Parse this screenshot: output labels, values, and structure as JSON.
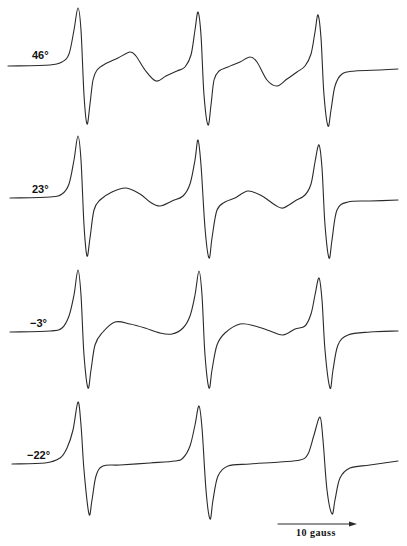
{
  "chart_data": {
    "type": "line",
    "title": "",
    "xlabel": "Magnetic field",
    "ylabel": "",
    "scale_bar": {
      "label": "10 gauss",
      "x1": 278,
      "x2": 357,
      "y": 524
    },
    "legend": [],
    "series": [
      {
        "name": "46°",
        "label": "46°",
        "label_pos": [
          32,
          55
        ],
        "points": [
          [
            8,
            66
          ],
          [
            50,
            65
          ],
          [
            62,
            62
          ],
          [
            69,
            54
          ],
          [
            74,
            30
          ],
          [
            78,
            8
          ],
          [
            81,
            30
          ],
          [
            84,
            95
          ],
          [
            87,
            124
          ],
          [
            90,
            104
          ],
          [
            93,
            80
          ],
          [
            97,
            70
          ],
          [
            105,
            64
          ],
          [
            118,
            58
          ],
          [
            130,
            52
          ],
          [
            136,
            56
          ],
          [
            145,
            70
          ],
          [
            156,
            81
          ],
          [
            166,
            76
          ],
          [
            177,
            71
          ],
          [
            185,
            67
          ],
          [
            191,
            55
          ],
          [
            195,
            30
          ],
          [
            198,
            12
          ],
          [
            201,
            35
          ],
          [
            204,
            95
          ],
          [
            208,
            125
          ],
          [
            211,
            105
          ],
          [
            214,
            80
          ],
          [
            219,
            71
          ],
          [
            228,
            67
          ],
          [
            240,
            62
          ],
          [
            250,
            57
          ],
          [
            257,
            62
          ],
          [
            267,
            80
          ],
          [
            277,
            86
          ],
          [
            287,
            79
          ],
          [
            297,
            72
          ],
          [
            305,
            66
          ],
          [
            311,
            54
          ],
          [
            315,
            32
          ],
          [
            318,
            15
          ],
          [
            321,
            38
          ],
          [
            324,
            95
          ],
          [
            328,
            126
          ],
          [
            331,
            110
          ],
          [
            335,
            86
          ],
          [
            342,
            74
          ],
          [
            355,
            71
          ],
          [
            380,
            70
          ],
          [
            398,
            69
          ]
        ]
      },
      {
        "name": "23°",
        "label": "23°",
        "label_pos": [
          32,
          189
        ],
        "points": [
          [
            10,
            198
          ],
          [
            50,
            197
          ],
          [
            62,
            194
          ],
          [
            69,
            184
          ],
          [
            74,
            160
          ],
          [
            78,
            136
          ],
          [
            81,
            160
          ],
          [
            84,
            225
          ],
          [
            87,
            256
          ],
          [
            90,
            238
          ],
          [
            94,
            210
          ],
          [
            100,
            200
          ],
          [
            112,
            192
          ],
          [
            126,
            188
          ],
          [
            140,
            194
          ],
          [
            150,
            202
          ],
          [
            160,
            206
          ],
          [
            172,
            201
          ],
          [
            183,
            196
          ],
          [
            190,
            184
          ],
          [
            195,
            160
          ],
          [
            198,
            140
          ],
          [
            201,
            165
          ],
          [
            205,
            228
          ],
          [
            209,
            258
          ],
          [
            212,
            238
          ],
          [
            217,
            210
          ],
          [
            225,
            202
          ],
          [
            235,
            198
          ],
          [
            248,
            191
          ],
          [
            262,
            196
          ],
          [
            275,
            205
          ],
          [
            283,
            208
          ],
          [
            295,
            201
          ],
          [
            305,
            195
          ],
          [
            311,
            184
          ],
          [
            315,
            162
          ],
          [
            319,
            145
          ],
          [
            322,
            168
          ],
          [
            325,
            225
          ],
          [
            329,
            258
          ],
          [
            332,
            240
          ],
          [
            337,
            210
          ],
          [
            348,
            202
          ],
          [
            370,
            201
          ],
          [
            398,
            200
          ]
        ]
      },
      {
        "name": "-3°",
        "label": "−3°",
        "label_pos": [
          30,
          323
        ],
        "points": [
          [
            10,
            332
          ],
          [
            50,
            331
          ],
          [
            62,
            328
          ],
          [
            69,
            316
          ],
          [
            74,
            295
          ],
          [
            78,
            270
          ],
          [
            81,
            295
          ],
          [
            84,
            355
          ],
          [
            88,
            388
          ],
          [
            91,
            370
          ],
          [
            95,
            345
          ],
          [
            102,
            333
          ],
          [
            115,
            322
          ],
          [
            130,
            324
          ],
          [
            145,
            328
          ],
          [
            160,
            333
          ],
          [
            172,
            334
          ],
          [
            183,
            328
          ],
          [
            190,
            316
          ],
          [
            195,
            295
          ],
          [
            199,
            271
          ],
          [
            202,
            295
          ],
          [
            205,
            355
          ],
          [
            209,
            388
          ],
          [
            212,
            370
          ],
          [
            217,
            345
          ],
          [
            225,
            333
          ],
          [
            240,
            324
          ],
          [
            255,
            326
          ],
          [
            270,
            331
          ],
          [
            283,
            335
          ],
          [
            295,
            329
          ],
          [
            305,
            326
          ],
          [
            311,
            314
          ],
          [
            315,
            295
          ],
          [
            319,
            278
          ],
          [
            322,
            300
          ],
          [
            325,
            350
          ],
          [
            330,
            388
          ],
          [
            333,
            370
          ],
          [
            338,
            345
          ],
          [
            348,
            335
          ],
          [
            370,
            332
          ],
          [
            398,
            331
          ]
        ]
      },
      {
        "name": "-22°",
        "label": "−22°",
        "label_pos": [
          27,
          455
        ],
        "points": [
          [
            12,
            464
          ],
          [
            45,
            463
          ],
          [
            60,
            458
          ],
          [
            67,
            448
          ],
          [
            73,
            430
          ],
          [
            78,
            402
          ],
          [
            81,
            425
          ],
          [
            84,
            470
          ],
          [
            89,
            514
          ],
          [
            92,
            500
          ],
          [
            96,
            476
          ],
          [
            103,
            466
          ],
          [
            120,
            465
          ],
          [
            150,
            463
          ],
          [
            175,
            461
          ],
          [
            183,
            458
          ],
          [
            190,
            446
          ],
          [
            195,
            425
          ],
          [
            199,
            406
          ],
          [
            202,
            428
          ],
          [
            206,
            490
          ],
          [
            210,
            519
          ],
          [
            213,
            500
          ],
          [
            218,
            476
          ],
          [
            228,
            466
          ],
          [
            250,
            464
          ],
          [
            280,
            462
          ],
          [
            300,
            460
          ],
          [
            308,
            454
          ],
          [
            314,
            435
          ],
          [
            320,
            417
          ],
          [
            323,
            440
          ],
          [
            327,
            490
          ],
          [
            332,
            514
          ],
          [
            335,
            500
          ],
          [
            340,
            478
          ],
          [
            350,
            468
          ],
          [
            370,
            465
          ],
          [
            398,
            461
          ]
        ]
      }
    ],
    "xlim": [
      0,
      407
    ],
    "grid": false
  }
}
